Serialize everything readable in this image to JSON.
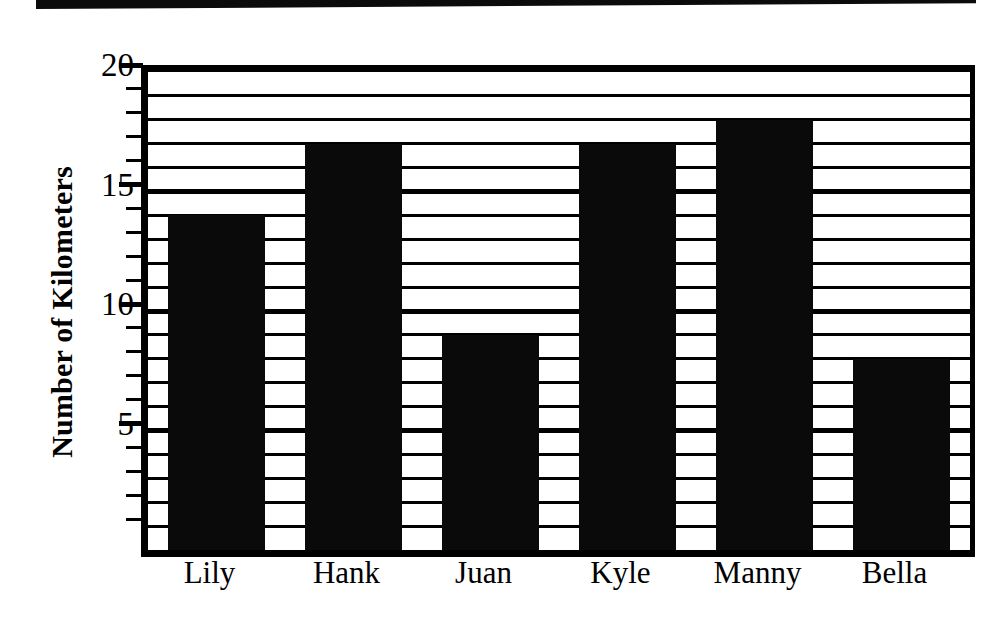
{
  "chart_data": {
    "type": "bar",
    "title": "",
    "xlabel": "",
    "ylabel": "Number of Kilometers",
    "categories": [
      "Lily",
      "Hank",
      "Juan",
      "Kyle",
      "Manny",
      "Bella"
    ],
    "values": [
      14,
      17,
      9,
      17,
      18,
      8
    ],
    "ylim": [
      0,
      20
    ],
    "y_major_ticks": [
      5,
      10,
      15,
      20
    ],
    "y_major_tick_labels": [
      "5",
      "10",
      "15",
      "20"
    ],
    "y_minor_tick_interval": 1,
    "grid": true,
    "grid_axis": "y",
    "legend": false,
    "legend_position": "none",
    "bar_color": "#0a0a0a",
    "background_color": "#ffffff",
    "axis_color": "#000000"
  },
  "figure": {
    "scan_banner_present": true
  }
}
